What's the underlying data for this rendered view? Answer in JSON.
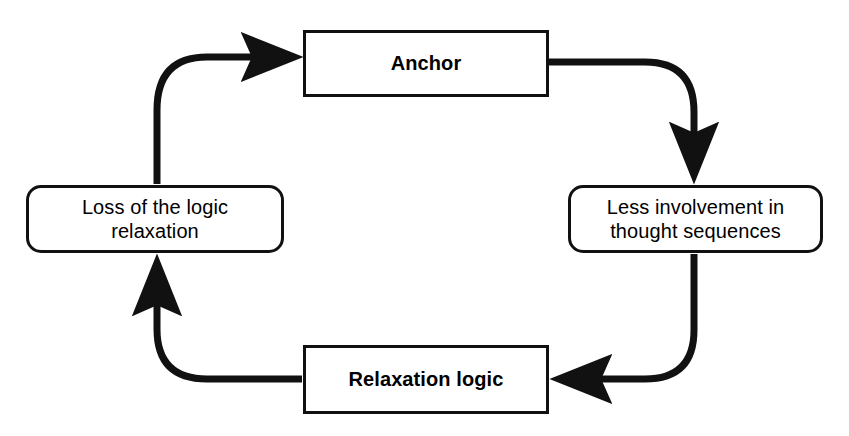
{
  "diagram": {
    "type": "cycle-flowchart",
    "direction": "clockwise",
    "background_color": "#ffffff",
    "stroke_color": "#111111",
    "text_color": "#000000",
    "nodes": [
      {
        "id": "anchor",
        "label": "Anchor",
        "shape": "rectangle",
        "emphasis": "bold",
        "position": "top"
      },
      {
        "id": "less_involvement",
        "label": "Less involvement in\nthought sequences",
        "shape": "rounded-rectangle",
        "emphasis": "regular",
        "position": "right"
      },
      {
        "id": "relaxation_logic",
        "label": "Relaxation logic",
        "shape": "rectangle",
        "emphasis": "bold",
        "position": "bottom"
      },
      {
        "id": "loss_of_logic",
        "label": "Loss of the logic\nrelaxation",
        "shape": "rounded-rectangle",
        "emphasis": "regular",
        "position": "left"
      }
    ],
    "edges": [
      {
        "id": "edge_anchor_to_less",
        "from": "anchor",
        "to": "less_involvement",
        "style": "curved-elbow",
        "arrowhead": "filled-triangle"
      },
      {
        "id": "edge_less_to_relaxation",
        "from": "less_involvement",
        "to": "relaxation_logic",
        "style": "curved-elbow",
        "arrowhead": "filled-triangle"
      },
      {
        "id": "edge_relaxation_to_loss",
        "from": "relaxation_logic",
        "to": "loss_of_logic",
        "style": "curved-elbow",
        "arrowhead": "filled-triangle"
      },
      {
        "id": "edge_loss_to_anchor",
        "from": "loss_of_logic",
        "to": "anchor",
        "style": "curved-elbow",
        "arrowhead": "filled-triangle"
      }
    ]
  }
}
